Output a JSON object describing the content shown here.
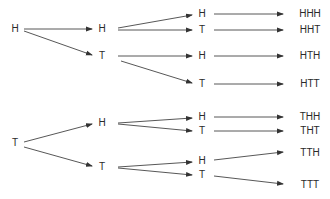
{
  "diagram": {
    "type": "probability-tree",
    "line_color": "#444444",
    "text_color": "#2a2a2a",
    "nodes": [
      {
        "id": "n0",
        "label": "H",
        "x": 15,
        "y": 29
      },
      {
        "id": "n1",
        "label": "T",
        "x": 15,
        "y": 143
      },
      {
        "id": "n2",
        "label": "H",
        "x": 102,
        "y": 29
      },
      {
        "id": "n3",
        "label": "T",
        "x": 102,
        "y": 56
      },
      {
        "id": "n4",
        "label": "H",
        "x": 102,
        "y": 123
      },
      {
        "id": "n5",
        "label": "T",
        "x": 102,
        "y": 167
      },
      {
        "id": "n6",
        "label": "H",
        "x": 202,
        "y": 14
      },
      {
        "id": "n7",
        "label": "T",
        "x": 202,
        "y": 30
      },
      {
        "id": "n8",
        "label": "H",
        "x": 202,
        "y": 56
      },
      {
        "id": "n9",
        "label": "T",
        "x": 202,
        "y": 84
      },
      {
        "id": "n10",
        "label": "H",
        "x": 202,
        "y": 117
      },
      {
        "id": "n11",
        "label": "T",
        "x": 202,
        "y": 131
      },
      {
        "id": "n12",
        "label": "H",
        "x": 202,
        "y": 161
      },
      {
        "id": "n13",
        "label": "T",
        "x": 202,
        "y": 175
      }
    ],
    "outcomes": [
      {
        "id": "o0",
        "label": "HHH",
        "x": 310,
        "y": 14
      },
      {
        "id": "o1",
        "label": "HHT",
        "x": 310,
        "y": 30
      },
      {
        "id": "o2",
        "label": "HTH",
        "x": 310,
        "y": 56
      },
      {
        "id": "o3",
        "label": "HTT",
        "x": 310,
        "y": 84
      },
      {
        "id": "o4",
        "label": "THH",
        "x": 310,
        "y": 117
      },
      {
        "id": "o5",
        "label": "THT",
        "x": 310,
        "y": 131
      },
      {
        "id": "o6",
        "label": "TTH",
        "x": 310,
        "y": 153
      },
      {
        "id": "o7",
        "label": "TTT",
        "x": 310,
        "y": 185
      }
    ],
    "edges": [
      {
        "x1": 24,
        "y1": 29,
        "x2": 92,
        "y2": 29
      },
      {
        "x1": 24,
        "y1": 31,
        "x2": 92,
        "y2": 55
      },
      {
        "x1": 118,
        "y1": 28,
        "x2": 192,
        "y2": 15
      },
      {
        "x1": 118,
        "y1": 30,
        "x2": 192,
        "y2": 30
      },
      {
        "x1": 118,
        "y1": 56,
        "x2": 192,
        "y2": 56
      },
      {
        "x1": 121,
        "y1": 61,
        "x2": 192,
        "y2": 83
      },
      {
        "x1": 24,
        "y1": 142,
        "x2": 92,
        "y2": 124
      },
      {
        "x1": 24,
        "y1": 147,
        "x2": 92,
        "y2": 166
      },
      {
        "x1": 118,
        "y1": 123,
        "x2": 192,
        "y2": 118
      },
      {
        "x1": 118,
        "y1": 124,
        "x2": 192,
        "y2": 131
      },
      {
        "x1": 118,
        "y1": 167,
        "x2": 192,
        "y2": 162
      },
      {
        "x1": 118,
        "y1": 168,
        "x2": 192,
        "y2": 175
      },
      {
        "x1": 214,
        "y1": 14,
        "x2": 283,
        "y2": 14
      },
      {
        "x1": 214,
        "y1": 30,
        "x2": 283,
        "y2": 30
      },
      {
        "x1": 214,
        "y1": 56,
        "x2": 283,
        "y2": 56
      },
      {
        "x1": 214,
        "y1": 84,
        "x2": 283,
        "y2": 84
      },
      {
        "x1": 214,
        "y1": 117,
        "x2": 283,
        "y2": 117
      },
      {
        "x1": 214,
        "y1": 131,
        "x2": 283,
        "y2": 131
      },
      {
        "x1": 214,
        "y1": 160,
        "x2": 283,
        "y2": 152
      },
      {
        "x1": 214,
        "y1": 176,
        "x2": 283,
        "y2": 184
      }
    ]
  }
}
